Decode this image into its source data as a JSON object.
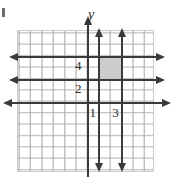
{
  "figure": {
    "width": 174,
    "height": 177,
    "background": "#ffffff",
    "corner_mark": "stray-bullet-mark"
  },
  "axes": {
    "y_axis_label": "y",
    "x_axis_name": "x-axis",
    "y_axis_name": "y-axis",
    "axis_color": "#3a3a3a",
    "grid_color": "#cfc9c9",
    "origin_px": {
      "x": 87,
      "y": 102
    },
    "unit_px": 11.4
  },
  "tick_labels": [
    {
      "text": "4",
      "axis": "y",
      "value": 4
    },
    {
      "text": "2",
      "axis": "y",
      "value": 2
    },
    {
      "text": "1",
      "axis": "x",
      "value": 1
    },
    {
      "text": "3",
      "axis": "x",
      "value": 3
    }
  ],
  "chart_data": {
    "type": "line",
    "title": "",
    "xlabel": "",
    "ylabel": "y",
    "grid": true,
    "legend": null,
    "xlim": [
      -6,
      6
    ],
    "ylim": [
      -6,
      6
    ],
    "boundary_lines": [
      {
        "name": "y = 4",
        "orientation": "horizontal",
        "value": 4,
        "style": "solid",
        "arrows": [
          "left",
          "right"
        ],
        "color": "#3a3a3a"
      },
      {
        "name": "y = 2",
        "orientation": "horizontal",
        "value": 2,
        "style": "solid",
        "arrows": [
          "left",
          "right"
        ],
        "color": "#3a3a3a"
      },
      {
        "name": "x = 1",
        "orientation": "vertical",
        "value": 1,
        "style": "solid",
        "arrows": [
          "up",
          "down"
        ],
        "color": "#3a3a3a"
      },
      {
        "name": "x = 3",
        "orientation": "vertical",
        "value": 3,
        "style": "solid",
        "arrows": [
          "up",
          "down"
        ],
        "color": "#3a3a3a"
      }
    ],
    "shaded_region": {
      "name": "solution-region",
      "x_range": [
        1,
        3
      ],
      "y_range": [
        2,
        4
      ],
      "fill": "#c9c9c9"
    }
  }
}
